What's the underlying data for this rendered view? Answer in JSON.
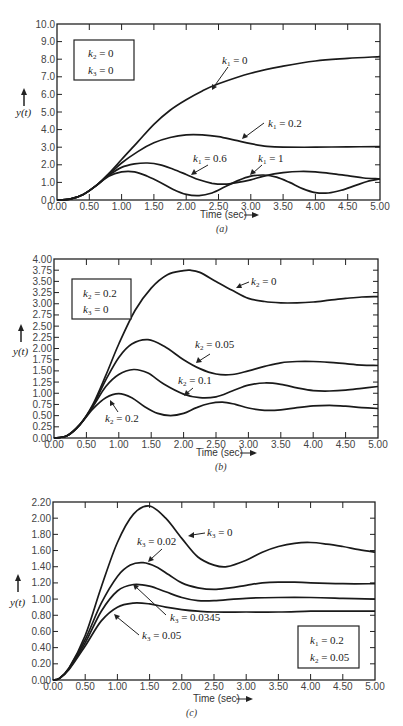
{
  "chart_data": [
    {
      "id": "a",
      "type": "line",
      "caption": "(a)",
      "xlabel": "Time (sec)",
      "ylabel": "y(t)",
      "xlim": [
        0,
        5
      ],
      "ylim": [
        0,
        10
      ],
      "x_ticks": [
        "0.00",
        "0.50",
        "1.00",
        "1.50",
        "2.00",
        "2.50",
        "3.00",
        "3.50",
        "4.00",
        "4.50",
        "5.00"
      ],
      "y_ticks": [
        "0.0",
        "1.0",
        "2.0",
        "3.0",
        "4.0",
        "5.0",
        "6.0",
        "7.0",
        "8.0",
        "9.0",
        "10.0"
      ],
      "legend_box": [
        "k2 = 0",
        "k3 = 0"
      ],
      "series": [
        {
          "name": "k1 = 0",
          "x": [
            0,
            0.2,
            0.4,
            0.6,
            0.8,
            1.0,
            1.25,
            1.5,
            1.75,
            2.0,
            2.25,
            2.5,
            3.0,
            3.5,
            4.0,
            4.5,
            5.0
          ],
          "values": [
            0,
            0.05,
            0.3,
            0.8,
            1.5,
            2.3,
            3.3,
            4.3,
            5.1,
            5.7,
            6.2,
            6.6,
            7.2,
            7.6,
            7.9,
            8.05,
            8.15
          ]
        },
        {
          "name": "k1 = 0.2",
          "x": [
            0,
            0.2,
            0.4,
            0.6,
            0.8,
            1.0,
            1.25,
            1.5,
            1.75,
            2.0,
            2.25,
            2.5,
            2.75,
            3.0,
            3.25,
            3.5,
            4.0,
            4.5,
            5.0
          ],
          "values": [
            0,
            0.05,
            0.3,
            0.8,
            1.45,
            2.1,
            2.75,
            3.25,
            3.55,
            3.7,
            3.7,
            3.6,
            3.4,
            3.2,
            3.05,
            3.0,
            3.0,
            3.02,
            3.03
          ]
        },
        {
          "name": "k1 = 0.6",
          "x": [
            0,
            0.2,
            0.4,
            0.6,
            0.8,
            1.0,
            1.2,
            1.4,
            1.6,
            1.8,
            2.0,
            2.2,
            2.4,
            2.6,
            2.8,
            3.0,
            3.25,
            3.5,
            3.75,
            4.0,
            4.25,
            4.5,
            4.75,
            5.0
          ],
          "values": [
            0,
            0.05,
            0.3,
            0.8,
            1.4,
            1.85,
            2.05,
            2.1,
            2.0,
            1.75,
            1.45,
            1.15,
            0.95,
            0.9,
            1.0,
            1.15,
            1.4,
            1.55,
            1.62,
            1.6,
            1.5,
            1.38,
            1.25,
            1.2
          ]
        },
        {
          "name": "k1 = 1",
          "x": [
            0,
            0.2,
            0.4,
            0.6,
            0.8,
            1.0,
            1.2,
            1.4,
            1.6,
            1.8,
            2.0,
            2.2,
            2.4,
            2.6,
            2.8,
            3.0,
            3.2,
            3.4,
            3.6,
            3.8,
            4.0,
            4.2,
            4.4,
            4.6,
            4.8,
            5.0
          ],
          "values": [
            0,
            0.05,
            0.3,
            0.8,
            1.35,
            1.6,
            1.6,
            1.35,
            1.0,
            0.6,
            0.32,
            0.25,
            0.4,
            0.75,
            1.1,
            1.35,
            1.42,
            1.3,
            1.0,
            0.65,
            0.42,
            0.4,
            0.55,
            0.8,
            1.05,
            1.2
          ]
        }
      ],
      "annotations": [
        {
          "text": "k1 = 0",
          "at": [
            2.4,
            6.0
          ]
        },
        {
          "text": "k1 = 0.2",
          "at": [
            2.9,
            3.3
          ]
        },
        {
          "text": "k1 = 0.6",
          "at": [
            1.6,
            1.5
          ]
        },
        {
          "text": "k1 = 1",
          "at": [
            2.9,
            1.3
          ]
        }
      ]
    },
    {
      "id": "b",
      "type": "line",
      "caption": "(b)",
      "xlabel": "Time (sec)",
      "ylabel": "y(t)",
      "xlim": [
        0,
        5
      ],
      "ylim": [
        0,
        4
      ],
      "x_ticks": [
        "0.00",
        "0.50",
        "1.00",
        "1.50",
        "2.00",
        "2.50",
        "3.00",
        "3.50",
        "4.00",
        "4.50",
        "5.00"
      ],
      "y_ticks": [
        "0.00",
        "0.25",
        "0.50",
        "0.75",
        "1.00",
        "1.25",
        "1.50",
        "1.75",
        "2.00",
        "2.25",
        "2.50",
        "2.75",
        "3.00",
        "3.25",
        "3.50",
        "3.75",
        "4.00"
      ],
      "legend_box": [
        "k2 = 0.2",
        "k3 = 0"
      ],
      "series": [
        {
          "name": "k2 = 0",
          "x": [
            0,
            0.2,
            0.4,
            0.6,
            0.8,
            1.0,
            1.25,
            1.5,
            1.75,
            2.0,
            2.1,
            2.25,
            2.5,
            2.75,
            3.0,
            3.25,
            3.5,
            3.75,
            4.0,
            4.25,
            4.5,
            4.75,
            5.0
          ],
          "values": [
            0,
            0.05,
            0.3,
            0.75,
            1.4,
            2.1,
            2.85,
            3.35,
            3.65,
            3.74,
            3.75,
            3.7,
            3.5,
            3.3,
            3.12,
            3.05,
            3.02,
            3.02,
            3.04,
            3.08,
            3.12,
            3.15,
            3.16
          ]
        },
        {
          "name": "k2 = 0.05",
          "x": [
            0,
            0.2,
            0.4,
            0.6,
            0.8,
            1.0,
            1.2,
            1.45,
            1.7,
            2.0,
            2.25,
            2.5,
            2.75,
            3.0,
            3.25,
            3.5,
            3.75,
            4.0,
            4.25,
            4.5,
            4.75,
            5.0
          ],
          "values": [
            0,
            0.05,
            0.3,
            0.72,
            1.3,
            1.8,
            2.1,
            2.2,
            2.05,
            1.75,
            1.55,
            1.43,
            1.42,
            1.5,
            1.6,
            1.68,
            1.71,
            1.71,
            1.69,
            1.66,
            1.63,
            1.62
          ]
        },
        {
          "name": "k2 = 0.1",
          "x": [
            0,
            0.2,
            0.4,
            0.6,
            0.8,
            1.0,
            1.23,
            1.45,
            1.7,
            2.0,
            2.25,
            2.5,
            2.75,
            3.0,
            3.25,
            3.5,
            3.75,
            4.0,
            4.25,
            4.5,
            4.75,
            5.0
          ],
          "values": [
            0,
            0.05,
            0.3,
            0.7,
            1.15,
            1.42,
            1.53,
            1.45,
            1.2,
            0.98,
            0.9,
            0.92,
            1.05,
            1.18,
            1.23,
            1.2,
            1.12,
            1.06,
            1.05,
            1.07,
            1.11,
            1.15
          ]
        },
        {
          "name": "k2 = 0.2",
          "x": [
            0,
            0.2,
            0.4,
            0.6,
            0.8,
            1.0,
            1.2,
            1.4,
            1.6,
            1.8,
            2.0,
            2.2,
            2.4,
            2.6,
            2.8,
            3.0,
            3.25,
            3.5,
            3.75,
            4.0,
            4.25,
            4.5,
            4.75,
            5.0
          ],
          "values": [
            0,
            0.05,
            0.3,
            0.65,
            0.9,
            0.99,
            0.9,
            0.7,
            0.55,
            0.5,
            0.55,
            0.68,
            0.77,
            0.8,
            0.75,
            0.67,
            0.62,
            0.63,
            0.68,
            0.72,
            0.73,
            0.71,
            0.68,
            0.66
          ]
        }
      ],
      "annotations": [
        {
          "text": "k2 = 0",
          "at": [
            2.85,
            3.28
          ]
        },
        {
          "text": "k2 = 0.05",
          "at": [
            2.2,
            1.65
          ]
        },
        {
          "text": "k2 = 0.1",
          "at": [
            2.0,
            0.98
          ]
        },
        {
          "text": "k2 = 0.2",
          "at": [
            0.85,
            0.85
          ]
        }
      ]
    },
    {
      "id": "c",
      "type": "line",
      "caption": "(c)",
      "xlabel": "Time (sec)",
      "ylabel": "y(t)",
      "xlim": [
        0,
        5
      ],
      "ylim": [
        0,
        2.2
      ],
      "x_ticks": [
        "0.00",
        "0.50",
        "1.00",
        "1.50",
        "2.00",
        "2.50",
        "3.00",
        "3.50",
        "4.00",
        "4.50",
        "5.00"
      ],
      "y_ticks": [
        "0.00",
        "0.20",
        "0.40",
        "0.60",
        "0.80",
        "1.00",
        "1.20",
        "1.40",
        "1.60",
        "1.80",
        "2.00",
        "2.20"
      ],
      "legend_box": [
        "k1 = 0.2",
        "k2 = 0.05"
      ],
      "series": [
        {
          "name": "k3 = 0",
          "x": [
            0,
            0.1,
            0.25,
            0.5,
            0.75,
            1.0,
            1.25,
            1.5,
            1.75,
            2.0,
            2.25,
            2.5,
            2.7,
            3.0,
            3.25,
            3.5,
            3.75,
            4.0,
            4.25,
            4.5,
            4.75,
            5.0
          ],
          "values": [
            0,
            0.02,
            0.15,
            0.55,
            1.15,
            1.7,
            2.05,
            2.15,
            2.0,
            1.75,
            1.52,
            1.42,
            1.4,
            1.48,
            1.58,
            1.65,
            1.69,
            1.7,
            1.68,
            1.65,
            1.61,
            1.58
          ]
        },
        {
          "name": "k3 = 0.02",
          "x": [
            0,
            0.1,
            0.25,
            0.5,
            0.75,
            1.0,
            1.2,
            1.4,
            1.6,
            1.8,
            2.0,
            2.25,
            2.5,
            2.75,
            3.0,
            3.25,
            3.5,
            3.75,
            4.0,
            4.5,
            5.0
          ],
          "values": [
            0,
            0.02,
            0.15,
            0.5,
            0.95,
            1.28,
            1.42,
            1.45,
            1.4,
            1.3,
            1.2,
            1.14,
            1.12,
            1.14,
            1.17,
            1.2,
            1.21,
            1.21,
            1.2,
            1.19,
            1.19
          ]
        },
        {
          "name": "k3 = 0.0345",
          "x": [
            0,
            0.1,
            0.25,
            0.5,
            0.75,
            1.0,
            1.25,
            1.5,
            1.75,
            2.0,
            2.25,
            2.5,
            3.0,
            3.5,
            4.0,
            4.5,
            5.0
          ],
          "values": [
            0,
            0.02,
            0.14,
            0.46,
            0.85,
            1.1,
            1.18,
            1.16,
            1.09,
            1.02,
            0.98,
            0.98,
            1.01,
            1.02,
            1.02,
            1.01,
            1.0
          ]
        },
        {
          "name": "k3 = 0.05",
          "x": [
            0,
            0.1,
            0.25,
            0.5,
            0.75,
            1.0,
            1.25,
            1.5,
            1.75,
            2.0,
            2.25,
            2.5,
            3.0,
            3.5,
            4.0,
            4.5,
            5.0
          ],
          "values": [
            0,
            0.02,
            0.13,
            0.42,
            0.73,
            0.9,
            0.95,
            0.94,
            0.9,
            0.87,
            0.85,
            0.84,
            0.84,
            0.84,
            0.85,
            0.85,
            0.85
          ]
        }
      ],
      "annotations": [
        {
          "text": "k3 = 0",
          "at": [
            1.8,
            1.8
          ]
        },
        {
          "text": "k3 = 0.02",
          "at": [
            1.4,
            1.45
          ]
        },
        {
          "text": "k3 = 0.0345",
          "at": [
            1.25,
            1.17
          ]
        },
        {
          "text": "k3 = 0.05",
          "at": [
            0.95,
            0.8
          ]
        }
      ]
    }
  ],
  "charts": {
    "a": {
      "caption": "(a)",
      "xlabel": "Time (sec)",
      "ylabel": "y(t)",
      "box_line1_var": "k",
      "box_line1_sub": "2",
      "box_line1_val": " = 0",
      "box_line2_var": "k",
      "box_line2_sub": "3",
      "box_line2_val": " = 0",
      "lab1_sub": "1",
      "lab1_val": " = 0",
      "lab2_sub": "1",
      "lab2_val": " = 0.2",
      "lab3_sub": "1",
      "lab3_val": " = 0.6",
      "lab4_sub": "1",
      "lab4_val": " = 1"
    },
    "b": {
      "caption": "(b)",
      "xlabel": "Time (sec)",
      "ylabel": "y(t)",
      "box_line1_sub": "2",
      "box_line1_val": " = 0.2",
      "box_line2_sub": "3",
      "box_line2_val": " = 0",
      "lab1_sub": "2",
      "lab1_val": " = 0",
      "lab2_sub": "2",
      "lab2_val": " = 0.05",
      "lab3_sub": "2",
      "lab3_val": " = 0.1",
      "lab4_sub": "2",
      "lab4_val": " = 0.2"
    },
    "c": {
      "caption": "(c)",
      "xlabel": "Time (sec)",
      "ylabel": "y(t)",
      "box_line1_sub": "1",
      "box_line1_val": " = 0.2",
      "box_line2_sub": "2",
      "box_line2_val": " = 0.05",
      "lab1_sub": "3",
      "lab1_val": " = 0",
      "lab2_sub": "3",
      "lab2_val": " = 0.02",
      "lab3_sub": "3",
      "lab3_val": " = 0.0345",
      "lab4_sub": "3",
      "lab4_val": " = 0.05"
    },
    "var": "k"
  },
  "layout": {
    "a": {
      "left": 57,
      "right": 380,
      "top": 24,
      "bottom": 200
    },
    "b": {
      "left": 54,
      "right": 378,
      "top": 259,
      "bottom": 438
    },
    "c": {
      "left": 53,
      "right": 375,
      "top": 502,
      "bottom": 680
    }
  }
}
